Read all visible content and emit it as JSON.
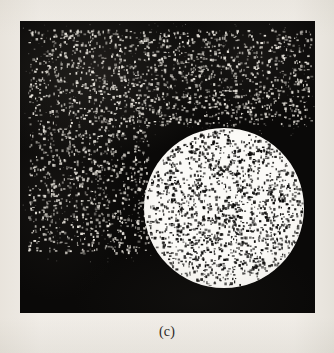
{
  "figure": {
    "caption": "(c)",
    "panel": {
      "background_color": "#0a0908",
      "page_background_color": "#f6f4f1",
      "left": 20,
      "top": 21,
      "width": 295,
      "height": 292
    },
    "disc": {
      "label": "noisy-white-disc",
      "fill_color": "#fbfaf7",
      "center_x": 204,
      "center_y": 187,
      "radius": 80,
      "speckle_color": "#0a0908",
      "speckle_density": 0.075,
      "speckle_min_size": 1,
      "speckle_max_size": 3
    },
    "speckle_regions": [
      {
        "label": "upper-band-salt-noise",
        "x": 8,
        "y": 8,
        "width": 283,
        "height": 96,
        "color": "#e8e4dc",
        "density": 0.055,
        "min_size": 1,
        "max_size": 2
      },
      {
        "label": "left-column-salt-noise",
        "x": 8,
        "y": 104,
        "width": 120,
        "height": 128,
        "color": "#e8e4dc",
        "density": 0.05,
        "min_size": 1,
        "max_size": 2
      }
    ]
  }
}
